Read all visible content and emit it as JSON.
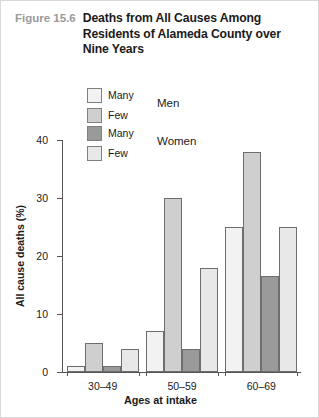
{
  "figure": {
    "number": "Figure 15.6",
    "title": "Deaths from All Causes Among Residents of Alameda County over Nine Years"
  },
  "legend": {
    "groups": [
      {
        "name": "Men",
        "entries": [
          {
            "label": "Many",
            "color": "#f2f2f2"
          },
          {
            "label": "Few",
            "color": "#cfcfcf"
          }
        ]
      },
      {
        "name": "Women",
        "entries": [
          {
            "label": "Many",
            "color": "#9a9a9a"
          },
          {
            "label": "Few",
            "color": "#e8e8e8"
          }
        ]
      }
    ]
  },
  "chart_data": {
    "type": "bar",
    "title": "Deaths from All Causes Among Residents of Alameda County over Nine Years",
    "xlabel": "Ages at intake",
    "ylabel": "All cause deaths (%)",
    "categories": [
      "30–49",
      "50–59",
      "60–69"
    ],
    "yticks": [
      0,
      10,
      20,
      30,
      40
    ],
    "ylim": [
      0,
      40
    ],
    "grid": false,
    "legend_position": "top",
    "series": [
      {
        "name": "Men — Many",
        "color": "#f2f2f2",
        "values": [
          1,
          7,
          25
        ]
      },
      {
        "name": "Men — Few",
        "color": "#cfcfcf",
        "values": [
          5,
          30,
          38
        ]
      },
      {
        "name": "Women — Many",
        "color": "#9a9a9a",
        "values": [
          1,
          4,
          16.5
        ]
      },
      {
        "name": "Women — Few",
        "color": "#e8e8e8",
        "values": [
          4,
          18,
          25
        ]
      }
    ]
  }
}
